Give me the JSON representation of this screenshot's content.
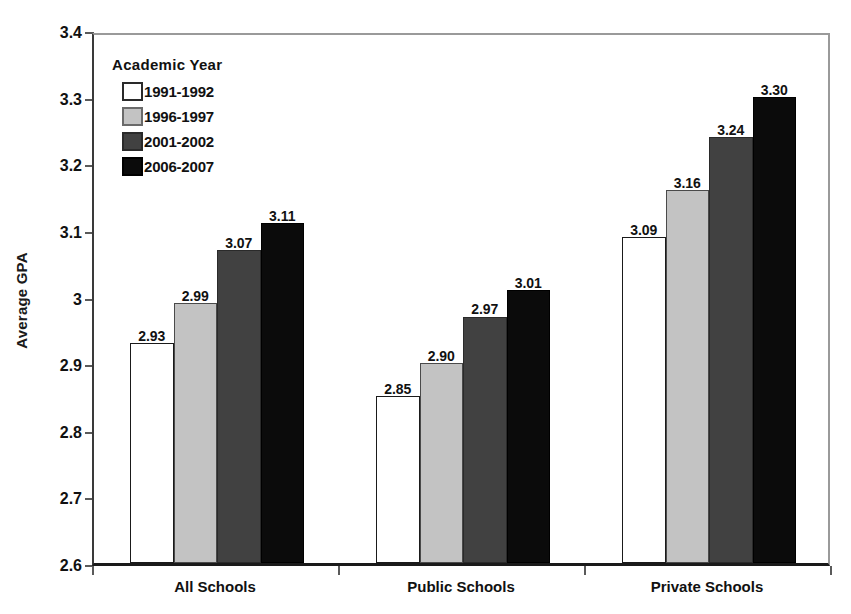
{
  "chart_data": {
    "type": "bar",
    "title": "",
    "xlabel": "",
    "ylabel": "Average GPA",
    "ylim": [
      2.6,
      3.4
    ],
    "ytick_labels": [
      "3.4",
      "3.3",
      "3.2",
      "3.1",
      "3",
      "2.9",
      "2.8",
      "2.7",
      "2.6"
    ],
    "ytick_values": [
      3.4,
      3.3,
      3.2,
      3.1,
      3.0,
      2.9,
      2.8,
      2.7,
      2.6
    ],
    "grid": false,
    "legend_position": "top-left-inside",
    "legend_title": "Academic Year",
    "categories": [
      "All Schools",
      "Public Schools",
      "Private Schools"
    ],
    "series": [
      {
        "name": "1991-1992",
        "color": "#ffffff",
        "values": [
          2.93,
          2.85,
          3.09
        ],
        "labels": [
          "2.93",
          "2.85",
          "3.09"
        ]
      },
      {
        "name": "1996-1997",
        "color": "#c3c3c3",
        "values": [
          2.99,
          2.9,
          3.16
        ],
        "labels": [
          "2.99",
          "2.90",
          "3.16"
        ]
      },
      {
        "name": "2001-2002",
        "color": "#414141",
        "values": [
          3.07,
          2.97,
          3.24
        ],
        "labels": [
          "3.07",
          "2.97",
          "3.24"
        ]
      },
      {
        "name": "2006-2007",
        "color": "#0b0b0b",
        "values": [
          3.11,
          3.01,
          3.3
        ],
        "labels": [
          "3.11",
          "3.01",
          "3.30"
        ]
      }
    ]
  },
  "axis": {
    "y_title": "Average GPA"
  },
  "legend": {
    "title": "Academic Year",
    "items": [
      {
        "label": "1991-1992",
        "swatch": "swatch-white"
      },
      {
        "label": "1996-1997",
        "swatch": "swatch-light"
      },
      {
        "label": "2001-2002",
        "swatch": "swatch-dark"
      },
      {
        "label": "2006-2007",
        "swatch": "swatch-black"
      }
    ]
  },
  "colors": {
    "series_1991_1992": "#ffffff",
    "series_1996_1997": "#c3c3c3",
    "series_2001_2002": "#414141",
    "series_2006_2007": "#0b0b0b",
    "axis": "#1a1a1a",
    "text": "#111111"
  }
}
